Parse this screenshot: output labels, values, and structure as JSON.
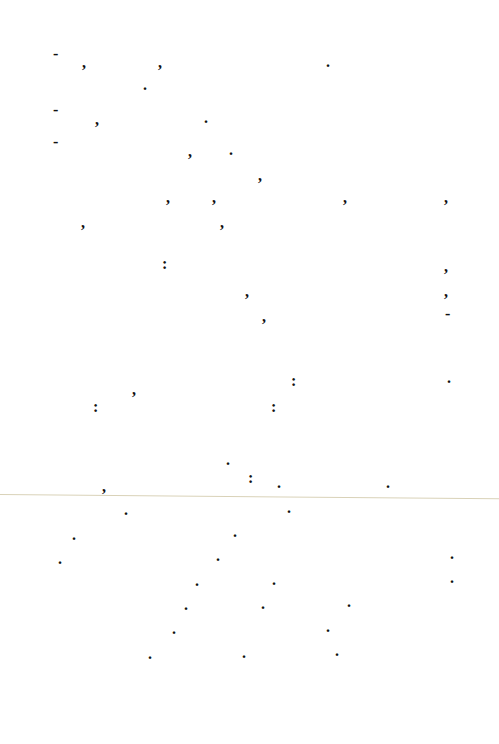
{
  "page": {
    "rule_color": "#d9d2b8",
    "marks": [
      {
        "c": "-",
        "x": 53,
        "y": 54
      },
      {
        "c": ",",
        "x": 82,
        "y": 63
      },
      {
        "c": ",",
        "x": 158,
        "y": 63
      },
      {
        "c": ".",
        "x": 326,
        "y": 62
      },
      {
        "c": ".",
        "x": 143,
        "y": 85
      },
      {
        "c": "-",
        "x": 53,
        "y": 110
      },
      {
        "c": ",",
        "x": 95,
        "y": 120
      },
      {
        "c": ".",
        "x": 204,
        "y": 118
      },
      {
        "c": "-",
        "x": 53,
        "y": 142
      },
      {
        "c": ",",
        "x": 188,
        "y": 152
      },
      {
        "c": ".",
        "x": 229,
        "y": 150
      },
      {
        "c": ",",
        "x": 258,
        "y": 176
      },
      {
        "c": ",",
        "x": 166,
        "y": 198
      },
      {
        "c": ",",
        "x": 212,
        "y": 198
      },
      {
        "c": ",",
        "x": 343,
        "y": 198
      },
      {
        "c": ",",
        "x": 444,
        "y": 198
      },
      {
        "c": ",",
        "x": 81,
        "y": 223
      },
      {
        "c": ",",
        "x": 220,
        "y": 223
      },
      {
        "c": ":",
        "x": 162,
        "y": 264
      },
      {
        "c": ",",
        "x": 444,
        "y": 267
      },
      {
        "c": ",",
        "x": 245,
        "y": 292
      },
      {
        "c": ",",
        "x": 444,
        "y": 292
      },
      {
        "c": ",",
        "x": 262,
        "y": 317
      },
      {
        "c": "-",
        "x": 445,
        "y": 314
      },
      {
        "c": ":",
        "x": 291,
        "y": 381
      },
      {
        "c": ".",
        "x": 447,
        "y": 378
      },
      {
        "c": ",",
        "x": 132,
        "y": 390
      },
      {
        "c": ":",
        "x": 93,
        "y": 407
      },
      {
        "c": ":",
        "x": 271,
        "y": 407
      },
      {
        "c": ".",
        "x": 226,
        "y": 460
      },
      {
        "c": ":",
        "x": 248,
        "y": 478
      },
      {
        "c": ".",
        "x": 277,
        "y": 483
      },
      {
        "c": ".",
        "x": 386,
        "y": 483
      },
      {
        "c": ",",
        "x": 102,
        "y": 487
      },
      {
        "c": ".",
        "x": 124,
        "y": 510
      },
      {
        "c": ".",
        "x": 287,
        "y": 508
      },
      {
        "c": ".",
        "x": 72,
        "y": 535
      },
      {
        "c": ".",
        "x": 233,
        "y": 532
      },
      {
        "c": ".",
        "x": 58,
        "y": 559
      },
      {
        "c": ".",
        "x": 216,
        "y": 556
      },
      {
        "c": ".",
        "x": 450,
        "y": 554
      },
      {
        "c": ".",
        "x": 195,
        "y": 581
      },
      {
        "c": ".",
        "x": 272,
        "y": 580
      },
      {
        "c": ".",
        "x": 450,
        "y": 578
      },
      {
        "c": ".",
        "x": 184,
        "y": 605
      },
      {
        "c": ".",
        "x": 261,
        "y": 604
      },
      {
        "c": ".",
        "x": 347,
        "y": 602
      },
      {
        "c": ".",
        "x": 172,
        "y": 629
      },
      {
        "c": ".",
        "x": 326,
        "y": 627
      },
      {
        "c": ".",
        "x": 148,
        "y": 654
      },
      {
        "c": ".",
        "x": 242,
        "y": 653
      },
      {
        "c": ".",
        "x": 335,
        "y": 651
      }
    ]
  }
}
